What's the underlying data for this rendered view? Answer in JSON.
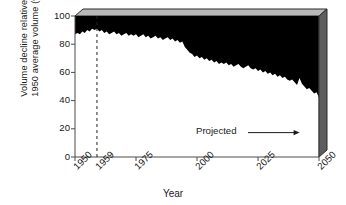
{
  "chart_data": {
    "type": "area",
    "title": "",
    "xlabel": "Year",
    "ylabel_line1": "Volume decline relative to",
    "ylabel_line2": "1950 average volume (%)",
    "xlim": [
      1950,
      2050
    ],
    "ylim": [
      0,
      100
    ],
    "grid": false,
    "legend_position": "none",
    "xticks": [
      1950,
      1959,
      1975,
      2000,
      2025,
      2050
    ],
    "xtick_labels": [
      "1950",
      "1959",
      "1975",
      "2000",
      "2025",
      "2050"
    ],
    "yticks": [
      0,
      20,
      40,
      60,
      80,
      100
    ],
    "ytick_labels": [
      "0",
      "20",
      "40",
      "60",
      "80",
      "100"
    ],
    "series_name": "Remaining volume (white area boundary)",
    "fill_above_color": "#000000",
    "fill_below_color": "#ffffff",
    "x": [
      1950,
      1951,
      1952,
      1953,
      1954,
      1955,
      1956,
      1957,
      1958,
      1959,
      1960,
      1961,
      1962,
      1963,
      1964,
      1965,
      1966,
      1967,
      1968,
      1969,
      1970,
      1971,
      1972,
      1973,
      1974,
      1975,
      1976,
      1977,
      1978,
      1979,
      1980,
      1981,
      1982,
      1983,
      1984,
      1985,
      1986,
      1987,
      1988,
      1989,
      1990,
      1991,
      1992,
      1993,
      1994,
      1995,
      1996,
      1997,
      1998,
      1999,
      2000,
      2001,
      2002,
      2003,
      2004,
      2005,
      2006,
      2007,
      2008,
      2009,
      2010,
      2011,
      2012,
      2013,
      2014,
      2015,
      2016,
      2017,
      2018,
      2019,
      2020,
      2021,
      2022,
      2023,
      2024,
      2025,
      2026,
      2027,
      2028,
      2029,
      2030,
      2031,
      2032,
      2033,
      2034,
      2035,
      2036,
      2037,
      2038,
      2039,
      2040,
      2041,
      2042,
      2043,
      2044,
      2045,
      2046,
      2047,
      2048,
      2049,
      2050
    ],
    "values": [
      87,
      88,
      87,
      89,
      88,
      90,
      89,
      91,
      90,
      91,
      89,
      90,
      88,
      89,
      87,
      88,
      89,
      87,
      88,
      86,
      87,
      88,
      86,
      87,
      86,
      87,
      85,
      86,
      87,
      85,
      86,
      84,
      85,
      86,
      84,
      85,
      83,
      84,
      85,
      83,
      84,
      82,
      83,
      81,
      82,
      78,
      76,
      74,
      73,
      71,
      72,
      70,
      71,
      69,
      70,
      68,
      69,
      67,
      68,
      66,
      67,
      66,
      67,
      65,
      66,
      64,
      65,
      66,
      64,
      63,
      64,
      65,
      63,
      62,
      63,
      61,
      62,
      60,
      61,
      59,
      60,
      58,
      59,
      57,
      58,
      56,
      57,
      55,
      54,
      55,
      53,
      51,
      56,
      52,
      50,
      48,
      49,
      47,
      45,
      46,
      42
    ],
    "annotations": [
      {
        "text": "Projected",
        "x_start": 2000,
        "y": 18,
        "arrow_to_x": 2040,
        "arrow": "right"
      }
    ],
    "reference_line": {
      "x": 1959,
      "style": "dashed",
      "label": "1959"
    }
  },
  "style": {
    "axis_color": "#4a4a4a",
    "text_color": "#1a1a1a",
    "bevel_top_color": "#b8b8b8",
    "bevel_side_color": "#5e5e5e",
    "bevel_edge_color": "#2a2a2a"
  }
}
